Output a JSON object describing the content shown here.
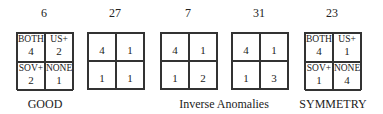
{
  "matrices": [
    {
      "number": "6",
      "cells": [
        {
          "label": "BOTH",
          "value": "4"
        },
        {
          "label": "US+",
          "value": "2"
        },
        {
          "label": "SOV+",
          "value": "2"
        },
        {
          "label": "NONE",
          "value": "1"
        }
      ]
    },
    {
      "number": "27",
      "cells": [
        {
          "label": "",
          "value": "4"
        },
        {
          "label": "",
          "value": "1"
        },
        {
          "label": "",
          "value": "1"
        },
        {
          "label": "",
          "value": "1"
        }
      ]
    },
    {
      "number": "7",
      "cells": [
        {
          "label": "",
          "value": "4"
        },
        {
          "label": "",
          "value": "1"
        },
        {
          "label": "",
          "value": "1"
        },
        {
          "label": "",
          "value": "2"
        }
      ]
    },
    {
      "number": "31",
      "cells": [
        {
          "label": "",
          "value": "4"
        },
        {
          "label": "",
          "value": "1"
        },
        {
          "label": "",
          "value": "1"
        },
        {
          "label": "",
          "value": "3"
        }
      ]
    },
    {
      "number": "23",
      "cells": [
        {
          "label": "BOTH",
          "value": "4"
        },
        {
          "label": "US+",
          "value": "1"
        },
        {
          "label": "SOV+",
          "value": "1"
        },
        {
          "label": "NONE",
          "value": "4"
        }
      ]
    }
  ],
  "captions": {
    "good": "GOOD",
    "inverse": "Inverse Anomalies",
    "symmetry": "SYMMETRY"
  }
}
